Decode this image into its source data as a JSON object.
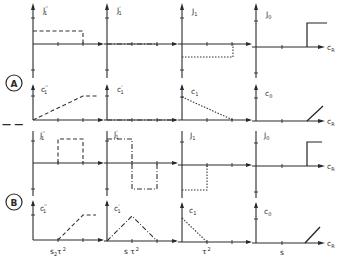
{
  "figure": {
    "sections": [
      {
        "id": "A",
        "label": "A",
        "rows": [
          {
            "quantity": "J",
            "panels": [
              {
                "label_main": "J",
                "label_sub": "1",
                "label_sup": "''",
                "line_style": "dashed"
              },
              {
                "label_main": "J",
                "label_sub": "1",
                "label_sup": "'",
                "line_style": "dash-dot"
              },
              {
                "label_main": "J",
                "label_sub": "1",
                "label_sup": "",
                "line_style": "dotted"
              },
              {
                "label_main": "J",
                "label_sub": "0",
                "label_sup": "",
                "line_style": "solid"
              }
            ]
          },
          {
            "quantity": "c",
            "panels": [
              {
                "label_main": "c",
                "label_sub": "1",
                "label_sup": "''",
                "line_style": "dashed"
              },
              {
                "label_main": "c",
                "label_sub": "1",
                "label_sup": "'",
                "line_style": "dash-dot"
              },
              {
                "label_main": "c",
                "label_sub": "1",
                "label_sup": "",
                "line_style": "dotted"
              },
              {
                "label_main": "c",
                "label_sub": "0",
                "label_sup": "",
                "line_style": "solid"
              }
            ]
          }
        ]
      },
      {
        "id": "B",
        "label": "B",
        "rows": [
          {
            "quantity": "J",
            "panels": [
              {
                "label_main": "J",
                "label_sub": "1",
                "label_sup": "''",
                "line_style": "dashed"
              },
              {
                "label_main": "J",
                "label_sub": "1",
                "label_sup": "'",
                "line_style": "dash-dot"
              },
              {
                "label_main": "J",
                "label_sub": "1",
                "label_sup": "",
                "line_style": "dotted"
              },
              {
                "label_main": "J",
                "label_sub": "0",
                "label_sup": "",
                "line_style": "solid"
              }
            ]
          },
          {
            "quantity": "c",
            "panels": [
              {
                "label_main": "c",
                "label_sub": "1",
                "label_sup": "''",
                "line_style": "dashed"
              },
              {
                "label_main": "c",
                "label_sub": "1",
                "label_sup": "'",
                "line_style": "dash-dot"
              },
              {
                "label_main": "c",
                "label_sub": "1",
                "label_sup": "",
                "line_style": "dotted"
              },
              {
                "label_main": "c",
                "label_sub": "0",
                "label_sup": "",
                "line_style": "solid"
              }
            ]
          }
        ]
      }
    ],
    "x_axis_label": {
      "main": "c",
      "sub": "R"
    },
    "bottom_labels": [
      {
        "text": "s",
        "sub": "2",
        "rest": "τ",
        "sup": "2"
      },
      {
        "text": "s τ",
        "sub": "",
        "rest": "",
        "sup": "2"
      },
      {
        "text": "τ",
        "sub": "",
        "rest": "",
        "sup": "2"
      },
      {
        "text": "s",
        "sub": "",
        "rest": "",
        "sup": ""
      }
    ],
    "separator": "— —"
  },
  "colors": {
    "ink": "#2a2a2a",
    "background": "#ffffff"
  }
}
